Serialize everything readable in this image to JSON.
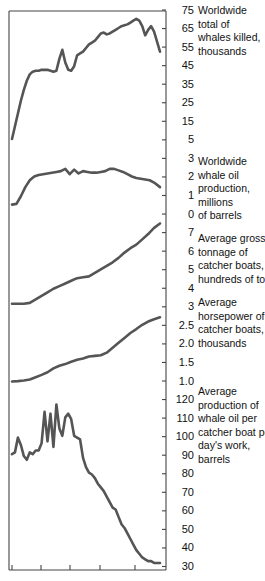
{
  "figure": {
    "kind": "multi-panel-line-chart",
    "background": "#ffffff",
    "line_color": "#555555",
    "axis_color": "#444444"
  },
  "axis": {
    "tick_labels": [
      "75",
      "65",
      "55",
      "45",
      "35",
      "25",
      "15",
      "5",
      "3",
      "2",
      "1",
      "0",
      "7",
      "6",
      "5",
      "4",
      "3",
      "2.5",
      "2.0",
      "1.5",
      "1.0",
      "120",
      "110",
      "100",
      "90",
      "80",
      "70",
      "60",
      "50",
      "40",
      "30"
    ]
  },
  "captions": [
    {
      "id": "caption-whales-killed",
      "text": "Worldwide\ntotal of\nwhales killed,\nthousands"
    },
    {
      "id": "caption-whale-oil-production",
      "text": "Worldwide\nwhale oil\nproduction,\nmillions\nof barrels"
    },
    {
      "id": "caption-gross-tonnage",
      "text": "Average gross\ntonnage of\ncatcher boats,\nhundreds of tons"
    },
    {
      "id": "caption-horsepower",
      "text": "Average\nhorsepower of\ncatcher boats,\nthousands"
    },
    {
      "id": "caption-oil-per-boat-day",
      "text": "Average\nproduction of\nwhale oil per\ncatcher boat per\nday's work,\nbarrels"
    }
  ],
  "chart_data": {
    "type": "line",
    "title": "",
    "xlabel": "",
    "ylabel": "",
    "grid": false,
    "legend": "right-of-axis-captions",
    "shared_x_axis": {
      "tick_positions_px": [
        12,
        41,
        70,
        100,
        135
      ],
      "range_px": [
        10,
        166
      ],
      "note": "unlabeled time axis, five tick marks along the bottom"
    },
    "panels": [
      {
        "name": "Worldwide total of whales killed, thousands",
        "ylabel": "thousands of whales killed",
        "ytick_labels": [
          "75",
          "65",
          "55",
          "45",
          "35",
          "25",
          "15",
          "5"
        ],
        "ylim": [
          0,
          78
        ],
        "x": [
          0,
          2,
          4,
          6,
          8,
          10,
          12,
          14,
          16,
          18,
          20,
          22,
          24,
          26,
          28,
          30,
          32,
          34,
          36,
          38,
          40,
          42,
          44,
          46,
          48,
          50,
          52,
          54,
          56,
          58,
          60,
          62,
          64,
          66,
          68,
          70,
          72,
          74,
          76,
          78,
          80,
          82,
          84,
          86,
          88,
          90,
          92,
          94,
          96,
          100
        ],
        "values": [
          6,
          13,
          20,
          27,
          33,
          38,
          41.5,
          43,
          43.5,
          43.5,
          44,
          44,
          44,
          43.5,
          43,
          43.5,
          50,
          55,
          48,
          44,
          43.5,
          46,
          52,
          53,
          54,
          56,
          58,
          59,
          60,
          62,
          64,
          64.5,
          63.5,
          64,
          65,
          66,
          67,
          68,
          68.5,
          69,
          70,
          71,
          72,
          71,
          68,
          63,
          66,
          68,
          65,
          54
        ]
      },
      {
        "name": "Worldwide whale oil production, millions of barrels",
        "ylabel": "millions of barrels",
        "ytick_labels": [
          "5",
          "3",
          "2",
          "1",
          "0"
        ],
        "ylim": [
          0,
          5.4
        ],
        "x": [
          0,
          3,
          6,
          9,
          12,
          15,
          18,
          21,
          24,
          27,
          30,
          33,
          36,
          39,
          42,
          45,
          48,
          51,
          54,
          57,
          60,
          63,
          66,
          69,
          72,
          75,
          78,
          81,
          84,
          87,
          90,
          93,
          96,
          100
        ],
        "values": [
          0.75,
          0.8,
          1.3,
          1.9,
          2.35,
          2.6,
          2.7,
          2.75,
          2.8,
          2.85,
          2.9,
          2.95,
          3.1,
          2.75,
          3.05,
          2.8,
          2.95,
          2.9,
          2.85,
          2.85,
          2.9,
          2.95,
          3.1,
          3.1,
          3.0,
          2.9,
          2.75,
          2.6,
          2.5,
          2.45,
          2.4,
          2.35,
          2.2,
          1.9
        ]
      },
      {
        "name": "Average gross tonnage of catcher boats, hundreds of tons",
        "ylabel": "hundreds of tons",
        "ytick_labels": [
          "7",
          "6",
          "5",
          "4",
          "3"
        ],
        "ylim": [
          2.6,
          7.6
        ],
        "x": [
          0,
          4,
          8,
          12,
          16,
          20,
          24,
          28,
          32,
          36,
          40,
          44,
          48,
          52,
          56,
          60,
          64,
          68,
          72,
          76,
          80,
          84,
          88,
          92,
          96,
          100
        ],
        "values": [
          3.0,
          3.0,
          3.0,
          3.05,
          3.25,
          3.45,
          3.65,
          3.85,
          4.0,
          4.15,
          4.3,
          4.45,
          4.5,
          4.55,
          4.75,
          4.95,
          5.15,
          5.35,
          5.6,
          5.9,
          6.15,
          6.35,
          6.65,
          6.95,
          7.3,
          7.55
        ]
      },
      {
        "name": "Average horsepower of catcher boats, thousands",
        "ylabel": "thousands of horsepower",
        "ytick_labels": [
          "2.5",
          "2.0",
          "1.5",
          "1.0"
        ],
        "ylim": [
          0.85,
          3.1
        ],
        "x": [
          0,
          4,
          8,
          12,
          16,
          20,
          24,
          28,
          32,
          36,
          40,
          44,
          48,
          52,
          56,
          60,
          64,
          68,
          72,
          76,
          80,
          84,
          88,
          92,
          96,
          100
        ],
        "values": [
          1.02,
          1.03,
          1.05,
          1.08,
          1.15,
          1.22,
          1.3,
          1.42,
          1.5,
          1.55,
          1.62,
          1.68,
          1.72,
          1.78,
          1.8,
          1.82,
          1.9,
          2.05,
          2.2,
          2.35,
          2.5,
          2.62,
          2.75,
          2.85,
          2.92,
          2.98
        ]
      },
      {
        "name": "Average production of whale oil per catcher boat per day's work, barrels",
        "ylabel": "barrels",
        "ytick_labels": [
          "120",
          "110",
          "100",
          "90",
          "80",
          "70",
          "60",
          "50",
          "40",
          "30"
        ],
        "ylim": [
          28,
          124
        ],
        "x": [
          0,
          2,
          4,
          6,
          8,
          10,
          12,
          14,
          16,
          18,
          20,
          22,
          24,
          26,
          28,
          30,
          32,
          34,
          36,
          38,
          40,
          42,
          44,
          46,
          48,
          50,
          52,
          54,
          56,
          58,
          60,
          62,
          64,
          66,
          68,
          70,
          72,
          74,
          76,
          78,
          80,
          82,
          84,
          86,
          88,
          90,
          92,
          94,
          96,
          98,
          100
        ],
        "values": [
          90,
          91,
          99,
          95,
          89,
          87,
          91,
          90,
          92,
          92,
          96,
          113,
          97,
          112,
          94,
          117,
          104,
          100,
          110,
          112,
          109,
          100,
          99,
          98,
          88,
          83,
          80,
          79,
          77,
          74,
          72,
          70,
          67,
          64,
          61,
          60,
          56,
          52,
          50,
          47,
          44,
          41,
          38,
          36,
          34,
          33,
          32,
          32,
          31,
          31,
          31
        ]
      }
    ]
  }
}
